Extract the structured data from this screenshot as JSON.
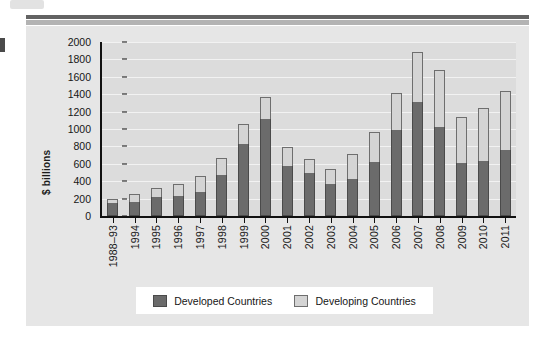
{
  "figure": {
    "background_color": "#e6e6e6",
    "plot_background_color": "#dcdcdc",
    "accent_developed": "#6b6b6b",
    "accent_developing": "#d4d4d4"
  },
  "legend": {
    "position": "bottom",
    "items": [
      {
        "label": "Developed Countries",
        "color": "#6b6b6b"
      },
      {
        "label": "Developing Countries",
        "color": "#d4d4d4"
      }
    ]
  },
  "chart_data": {
    "type": "bar",
    "stacked": true,
    "title": "",
    "xlabel": "",
    "ylabel": "$ billions",
    "ylim": [
      0,
      2000
    ],
    "ytick_step": 200,
    "yticks": [
      2000,
      1800,
      1600,
      1400,
      1200,
      1000,
      800,
      600,
      400,
      200,
      0
    ],
    "grid": true,
    "grid_axis": "y",
    "legend_position": "bottom",
    "categories": [
      "1988–93",
      "1994",
      "1995",
      "1996",
      "1997",
      "1998",
      "1999",
      "2000",
      "2001",
      "2002",
      "2003",
      "2004",
      "2005",
      "2006",
      "2007",
      "2008",
      "2009",
      "2010",
      "2011"
    ],
    "series": [
      {
        "name": "Developed Countries",
        "color": "#6b6b6b",
        "values": [
          145,
          160,
          215,
          230,
          275,
          470,
          830,
          1110,
          580,
          490,
          370,
          430,
          625,
          990,
          1310,
          1025,
          615,
          630,
          760
        ]
      },
      {
        "name": "Developing Countries",
        "color": "#d4d4d4",
        "values": [
          45,
          90,
          105,
          140,
          180,
          200,
          230,
          260,
          210,
          160,
          165,
          280,
          335,
          425,
          575,
          655,
          525,
          610,
          680
        ]
      }
    ],
    "totals": [
      190,
      250,
      320,
      370,
      455,
      670,
      1060,
      1370,
      790,
      650,
      535,
      710,
      960,
      1415,
      1885,
      1680,
      1140,
      1240,
      1440
    ]
  }
}
